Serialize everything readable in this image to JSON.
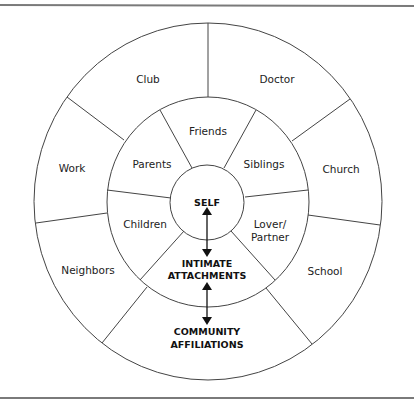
{
  "diagram": {
    "center": {
      "label": "SELF"
    },
    "middle_ring": {
      "title_line1": "INTIMATE",
      "title_line2": "ATTACHMENTS",
      "segments": [
        {
          "label": "Friends"
        },
        {
          "label": "Siblings"
        },
        {
          "label_line1": "Lover/",
          "label_line2": "Partner"
        },
        {
          "label": "Children"
        },
        {
          "label": "Parents"
        }
      ]
    },
    "outer_ring": {
      "title_line1": "COMMUNITY",
      "title_line2": "AFFILIATIONS",
      "segments": [
        {
          "label": "Club"
        },
        {
          "label": "Doctor"
        },
        {
          "label": "Church"
        },
        {
          "label": "School"
        },
        {
          "label": "Neighbors"
        },
        {
          "label": "Work"
        }
      ]
    },
    "arrows": [
      {
        "from": "SELF",
        "to": "INTIMATE ATTACHMENTS",
        "type": "bidirectional"
      },
      {
        "from": "INTIMATE ATTACHMENTS",
        "to": "COMMUNITY AFFILIATIONS",
        "type": "bidirectional"
      }
    ],
    "colors": {
      "line": "#444444",
      "text": "#222222",
      "rule": "#7a7a7a",
      "background": "#ffffff"
    }
  }
}
